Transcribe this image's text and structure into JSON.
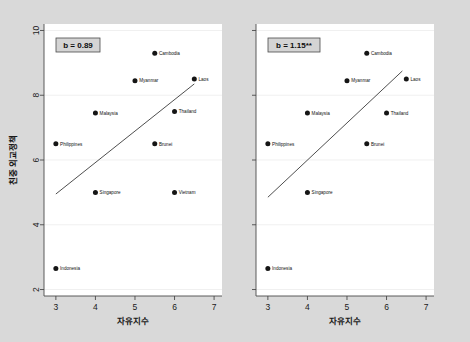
{
  "figure": {
    "background_color": "#d9d9d9",
    "plot_background_color": "#ffffff",
    "marker_color": "#151515",
    "line_color": "#3a3a3a"
  },
  "chart_data": [
    {
      "type": "scatter",
      "panel": "left",
      "title": "",
      "xlabel": "자유지수",
      "ylabel": "친중 외교정책",
      "xlim": [
        2.7,
        7.2
      ],
      "ylim": [
        1.8,
        10.2
      ],
      "xticks": [
        "3",
        "4",
        "5",
        "6",
        "7"
      ],
      "xtick_values": [
        3,
        4,
        5,
        6,
        7
      ],
      "yticks": [
        "10",
        "8",
        "6",
        "4",
        "2"
      ],
      "ytick_values": [
        10,
        8,
        6,
        4,
        2
      ],
      "grid": true,
      "annotation": "b = 0.89",
      "fit_line": {
        "x": [
          3.0,
          6.5
        ],
        "y": [
          4.95,
          8.35
        ]
      },
      "points": [
        {
          "label": "Cambodia",
          "x": 5.5,
          "y": 9.3
        },
        {
          "label": "Myanmar",
          "x": 5.0,
          "y": 8.45
        },
        {
          "label": "Laos",
          "x": 6.5,
          "y": 8.5
        },
        {
          "label": "Malaysia",
          "x": 4.0,
          "y": 7.45
        },
        {
          "label": "Thailand",
          "x": 6.0,
          "y": 7.5
        },
        {
          "label": "Philippines",
          "x": 3.0,
          "y": 6.5
        },
        {
          "label": "Brunei",
          "x": 5.5,
          "y": 6.5
        },
        {
          "label": "Singapore",
          "x": 4.0,
          "y": 5.0
        },
        {
          "label": "Vietnam",
          "x": 6.0,
          "y": 5.0
        },
        {
          "label": "Indonesia",
          "x": 3.0,
          "y": 2.65
        }
      ]
    },
    {
      "type": "scatter",
      "panel": "right",
      "title": "",
      "xlabel": "자유지수",
      "ylabel": "",
      "xlim": [
        2.7,
        7.2
      ],
      "ylim": [
        1.8,
        10.2
      ],
      "xticks": [
        "3",
        "4",
        "5",
        "6",
        "7"
      ],
      "xtick_values": [
        3,
        4,
        5,
        6,
        7
      ],
      "yticks": [
        "",
        "",
        "",
        "",
        ""
      ],
      "ytick_values": [
        10,
        8,
        6,
        4,
        2
      ],
      "grid": true,
      "annotation": "b = 1.15**",
      "fit_line": {
        "x": [
          3.0,
          6.4
        ],
        "y": [
          4.85,
          8.75
        ]
      },
      "points": [
        {
          "label": "Cambodia",
          "x": 5.5,
          "y": 9.3
        },
        {
          "label": "Myanmar",
          "x": 5.0,
          "y": 8.45
        },
        {
          "label": "Laos",
          "x": 6.5,
          "y": 8.5
        },
        {
          "label": "Malaysia",
          "x": 4.0,
          "y": 7.45
        },
        {
          "label": "Thailand",
          "x": 6.0,
          "y": 7.45
        },
        {
          "label": "Philippines",
          "x": 3.0,
          "y": 6.5
        },
        {
          "label": "Brunei",
          "x": 5.5,
          "y": 6.5
        },
        {
          "label": "Singapore",
          "x": 4.0,
          "y": 5.0
        },
        {
          "label": "Indonesia",
          "x": 3.0,
          "y": 2.65
        }
      ]
    }
  ]
}
